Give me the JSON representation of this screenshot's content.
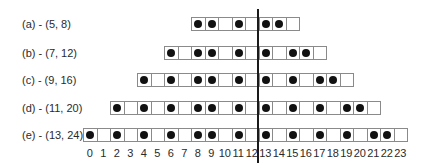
{
  "diagram": {
    "cell_origin_x": 83,
    "cell_width": 13.5,
    "divider_between": [
      12,
      13
    ],
    "rows": [
      {
        "id": "a",
        "label": "(a) - (5, 8)",
        "start": 8,
        "end": 15,
        "filled": [
          8,
          9,
          11,
          13,
          14
        ],
        "top": 17
      },
      {
        "id": "b",
        "label": "(b) - (7, 12)",
        "start": 6,
        "end": 17,
        "filled": [
          6,
          8,
          9,
          11,
          13,
          15,
          16
        ],
        "top": 46
      },
      {
        "id": "c",
        "label": "(c) - (9, 16)",
        "start": 4,
        "end": 19,
        "filled": [
          4,
          6,
          8,
          9,
          11,
          13,
          15,
          17,
          18
        ],
        "top": 73
      },
      {
        "id": "d",
        "label": "(d) - (11, 20)",
        "start": 2,
        "end": 21,
        "filled": [
          2,
          4,
          6,
          8,
          9,
          11,
          13,
          15,
          17,
          19,
          20
        ],
        "top": 101
      },
      {
        "id": "e",
        "label": "(e) - (13, 24)",
        "start": 0,
        "end": 23,
        "filled": [
          0,
          2,
          4,
          6,
          8,
          9,
          11,
          13,
          15,
          17,
          19,
          21,
          22
        ],
        "top": 128
      }
    ],
    "axis_ticks": [
      "0",
      "1",
      "2",
      "3",
      "4",
      "5",
      "6",
      "7",
      "8",
      "9",
      "10",
      "11",
      "12",
      "13",
      "14",
      "15",
      "16",
      "17",
      "18",
      "19",
      "20",
      "21",
      "22",
      "23"
    ]
  },
  "colors": {
    "dot": "#111111",
    "cell_border": "#8a8a8a",
    "divider": "#1a1a1a"
  }
}
